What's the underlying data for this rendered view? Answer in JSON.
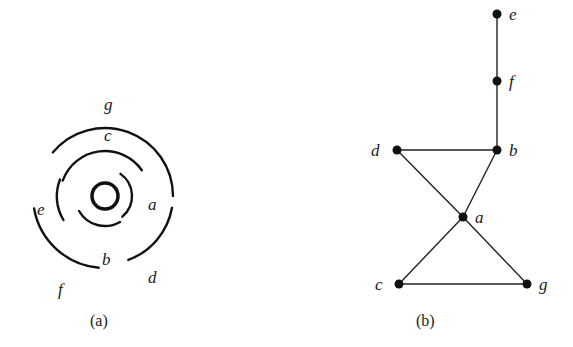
{
  "figure_a": {
    "caption": "(a)",
    "center": [
      105,
      196
    ],
    "ring": {
      "r": 13
    },
    "arcs": [
      {
        "label": "a",
        "r": 27,
        "start": -55,
        "end": 50,
        "label_pos": [
          148,
          210
        ]
      },
      {
        "label": "b",
        "r": 30,
        "start": 60,
        "end": 150,
        "label_pos": [
          102,
          265
        ]
      },
      {
        "label": "c",
        "r": 45,
        "start": 200,
        "end": 325,
        "label_pos": [
          104,
          141
        ]
      },
      {
        "label": "e",
        "r": 48,
        "start": 150,
        "end": 200,
        "label_pos": [
          37,
          215
        ]
      },
      {
        "label": "g",
        "r": 68,
        "start": 220,
        "end": 0,
        "label_pos": [
          104,
          110
        ]
      },
      {
        "label": "d",
        "r": 68,
        "start": 10,
        "end": 70,
        "label_pos": [
          148,
          283
        ]
      },
      {
        "label": "f",
        "r": 72,
        "start": 95,
        "end": 170,
        "label_pos": [
          58,
          295
        ]
      }
    ]
  },
  "figure_b": {
    "caption": "(b)",
    "nodes": [
      {
        "id": "e",
        "x": 497,
        "y": 14,
        "label_dx": 12,
        "label_dy": 6
      },
      {
        "id": "f",
        "x": 497,
        "y": 81,
        "label_dx": 12,
        "label_dy": 6
      },
      {
        "id": "d",
        "x": 397,
        "y": 150,
        "label_dx": -26,
        "label_dy": 6
      },
      {
        "id": "b",
        "x": 497,
        "y": 150,
        "label_dx": 12,
        "label_dy": 6
      },
      {
        "id": "a",
        "x": 463,
        "y": 217,
        "label_dx": 12,
        "label_dy": 6
      },
      {
        "id": "c",
        "x": 399,
        "y": 284,
        "label_dx": -24,
        "label_dy": 6
      },
      {
        "id": "g",
        "x": 527,
        "y": 284,
        "label_dx": 12,
        "label_dy": 6
      }
    ],
    "edges": [
      [
        "e",
        "f"
      ],
      [
        "f",
        "b"
      ],
      [
        "d",
        "b"
      ],
      [
        "d",
        "a"
      ],
      [
        "b",
        "a"
      ],
      [
        "a",
        "c"
      ],
      [
        "a",
        "g"
      ],
      [
        "c",
        "g"
      ]
    ]
  }
}
